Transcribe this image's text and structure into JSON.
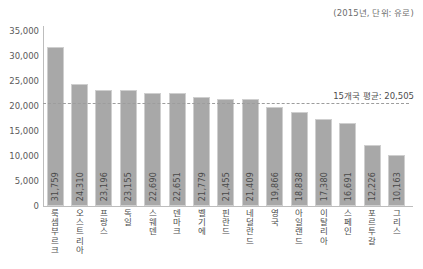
{
  "unit_note": "(2015년, 단위: 유로)",
  "average": {
    "label": "15개국 평균: 20,505",
    "value": 20505
  },
  "chart_data": {
    "type": "bar",
    "title": "",
    "subtitle": "(2015년, 단위: 유로)",
    "xlabel": "",
    "ylabel": "",
    "ylim": [
      0,
      35000
    ],
    "ytick_values": [
      0,
      5000,
      10000,
      15000,
      20000,
      25000,
      30000,
      35000
    ],
    "ytick_labels": [
      "0",
      "5,000",
      "10,000",
      "15,000",
      "20,000",
      "25,000",
      "30,000",
      "35,000"
    ],
    "grid": false,
    "legend": "none",
    "categories": [
      "룩셈부르크",
      "오스트리아",
      "프랑스",
      "독일",
      "스웨덴",
      "덴마크",
      "벨기에",
      "핀란드",
      "네덜란드",
      "영국",
      "아일랜드",
      "이탈리아",
      "스페인",
      "포르투갈",
      "그리스"
    ],
    "values": [
      31759,
      24310,
      23196,
      23155,
      22690,
      22651,
      21779,
      21455,
      21409,
      19866,
      18838,
      17380,
      16691,
      12226,
      10163
    ],
    "value_labels": [
      "31,759",
      "24,310",
      "23,196",
      "23,155",
      "22,690",
      "22,651",
      "21,779",
      "21,455",
      "21,409",
      "19,866",
      "18,838",
      "17,380",
      "16,691",
      "12,226",
      "10,163"
    ],
    "annotations": [
      {
        "type": "hline",
        "value": 20505,
        "label": "15개국 평균: 20,505",
        "style": "dashed"
      }
    ],
    "colors": {
      "bar_fill": "#a8a8a8",
      "bar_edge": "#cfcfcf",
      "axis": "#bdbdbd",
      "text": "#4d4d4d",
      "average_line": "#9d9d9d"
    }
  }
}
